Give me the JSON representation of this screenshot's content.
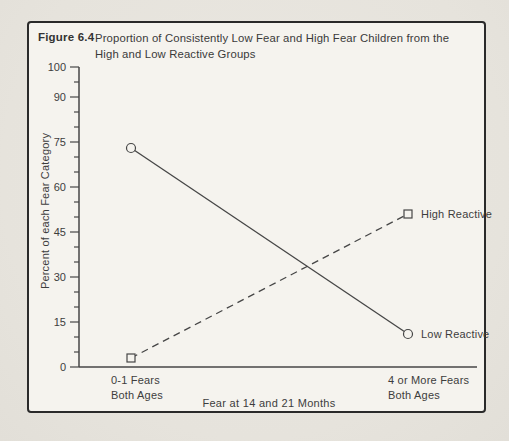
{
  "figure": {
    "label": "Figure 6.4",
    "title_line1": "Proportion of Consistently Low Fear and High Fear Children from the",
    "title_line2": "High and Low Reactive Groups"
  },
  "chart_data": {
    "type": "line",
    "title": "Proportion of Consistently Low Fear and High Fear Children from the High and Low Reactive Groups",
    "xlabel": "Fear at 14 and 21 Months",
    "ylabel": "Percent of each Fear Category",
    "categories": [
      {
        "line1": "0-1 Fears",
        "line2": "Both Ages"
      },
      {
        "line1": "4 or More Fears",
        "line2": "Both Ages"
      }
    ],
    "series": [
      {
        "name": "Low Reactive",
        "marker": "circle",
        "line_style": "solid",
        "values": [
          73,
          11
        ]
      },
      {
        "name": "High Reactive",
        "marker": "square",
        "line_style": "dashed",
        "values": [
          3,
          51
        ]
      }
    ],
    "ylim": [
      0,
      100
    ],
    "ytick_step": 5,
    "yticks_labeled": [
      0,
      15,
      30,
      45,
      60,
      75,
      90,
      100
    ],
    "grid": false,
    "legend_position": "right-of-last-point"
  },
  "colors": {
    "ink": "#3d3d3d",
    "line": "#464646",
    "border": "#2a2a2a",
    "paper_outer": "#e8e5df",
    "paper_inner": "#f5f3ee"
  }
}
